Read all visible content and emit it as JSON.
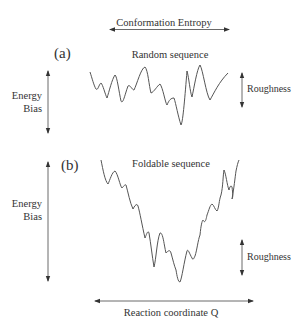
{
  "diagram": {
    "top_axis": {
      "label": "Conformation Entropy"
    },
    "panel_a": {
      "tag": "(a)",
      "title": "Random sequence",
      "energy_label_line1": "Energy",
      "energy_label_line2": "Bias",
      "roughness_label": "Roughness"
    },
    "panel_b": {
      "tag": "(b)",
      "title": "Foldable sequence",
      "energy_label_line1": "Energy",
      "energy_label_line2": "Bias",
      "roughness_label": "Roughness"
    },
    "bottom_axis": {
      "label": "Reaction coordinate Q"
    },
    "colors": {
      "ink": "#333333",
      "background": "#ffffff"
    }
  }
}
